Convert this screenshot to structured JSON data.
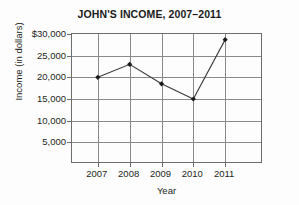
{
  "chart_data": {
    "type": "line",
    "title": "JOHN'S INCOME, 2007–2011",
    "xlabel": "Year",
    "ylabel": "Income (in dollars)",
    "categories": [
      "2007",
      "2008",
      "2009",
      "2010",
      "2011"
    ],
    "values": [
      20000,
      23000,
      18500,
      15000,
      28700
    ],
    "series": [
      {
        "name": "John's income",
        "values": [
          20000,
          23000,
          18500,
          15000,
          28700
        ]
      }
    ],
    "ylim": [
      0,
      30000
    ],
    "ytick_values": [
      5000,
      10000,
      15000,
      20000,
      25000,
      30000
    ],
    "ytick_labels": [
      "5,000",
      "10,000",
      "15,000",
      "20,000",
      "25,000",
      "$30,000"
    ],
    "xtick_labels": [
      "2007",
      "2008",
      "2009",
      "2010",
      "2011"
    ],
    "grid": true,
    "legend": "none",
    "marker": "diamond",
    "line_color": "#3a3a3a",
    "marker_color": "#1a1a1a",
    "grid_color": "#8a8a8a",
    "frame_color": "#6d6d6d",
    "background_color": "#fdfdfd"
  }
}
